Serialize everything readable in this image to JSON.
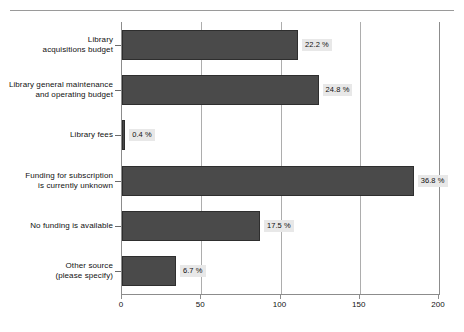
{
  "figure": {
    "top_fragment_text": "",
    "background": "#ffffff",
    "bar_color": "#4a4a4a",
    "bar_edge_color": "#2e2e2e",
    "value_label_background": "#e8e8e8",
    "axis_color": "#8c8c8c",
    "grid_color": "#adadad"
  },
  "chart_data": {
    "type": "bar",
    "orientation": "horizontal",
    "title": "",
    "subtitle": "",
    "xlabel": "",
    "ylabel": "",
    "xlim": [
      0,
      200
    ],
    "xticks": [
      0,
      50,
      100,
      150,
      200
    ],
    "xticklabels": [
      "0",
      "50",
      "100",
      "150",
      "200"
    ],
    "grid": true,
    "grid_axis": "x",
    "legend": false,
    "categories": [
      "Library\nacquisitions budget",
      "Library general maintenance\nand operating budget",
      "Library fees",
      "Funding for subscription\nis currently unknown",
      "No funding is available",
      "Other source\n(please specify)"
    ],
    "values": [
      111,
      124,
      2,
      184,
      87,
      34
    ],
    "data_labels": [
      "22.2 %",
      "24.8 %",
      "0.4 %",
      "36.8 %",
      "17.5 %",
      "6.7 %"
    ],
    "percentages": [
      22.2,
      24.8,
      0.4,
      36.8,
      17.5,
      6.7
    ],
    "value_unit": "count"
  }
}
